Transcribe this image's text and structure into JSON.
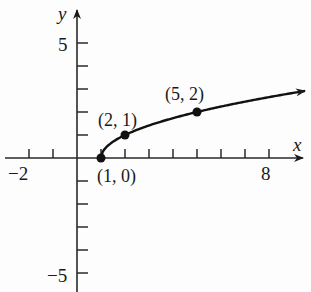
{
  "chart_data": {
    "type": "line",
    "title": "",
    "xlabel": "x",
    "ylabel": "y",
    "xlim": [
      -3,
      9.5
    ],
    "ylim": [
      -5.8,
      6.2
    ],
    "grid": false,
    "x_tick_labels": [
      {
        "value": -2,
        "label": "−2"
      },
      {
        "value": 8,
        "label": "8"
      }
    ],
    "y_tick_labels": [
      {
        "value": 5,
        "label": "5"
      },
      {
        "value": -5,
        "label": "−5"
      }
    ],
    "x_ticks": [
      -2,
      -1,
      1,
      2,
      3,
      4,
      5,
      6,
      7,
      8
    ],
    "y_ticks": [
      -5,
      -4,
      -3,
      -2,
      -1,
      1,
      2,
      3,
      4,
      5
    ],
    "series": [
      {
        "name": "y = sqrt(x - 1)",
        "function": "sqrt(x-1)",
        "domain_start": 1,
        "domain_end": 9.5,
        "arrow_at_end": true
      }
    ],
    "points": [
      {
        "x": 1,
        "y": 0,
        "label": "(1, 0)"
      },
      {
        "x": 2,
        "y": 1,
        "label": "(2, 1)"
      },
      {
        "x": 5,
        "y": 2,
        "label": "(5, 2)"
      }
    ]
  },
  "labels": {
    "x_axis": "x",
    "y_axis": "y",
    "x_neg2": "−2",
    "x_8": "8",
    "y_5": "5",
    "y_neg5": "−5",
    "p1": "(1, 0)",
    "p2": "(2, 1)",
    "p3": "(5, 2)"
  }
}
